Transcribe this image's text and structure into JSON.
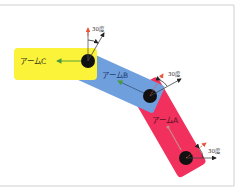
{
  "diagram": {
    "title": "",
    "colors": {
      "background": "#ffffff",
      "frame": "#d0d0d0",
      "arm_c": "#fbf23a",
      "arm_b": "#6f9fdc",
      "arm_a": "#f2305e",
      "joint": "#111111",
      "axis_line": "#333333",
      "reference_arrow": "#e8553a",
      "direction_arrow": "#4a9a3a"
    },
    "arms": [
      {
        "id": "C",
        "label": "アームC"
      },
      {
        "id": "B",
        "label": "アームB"
      },
      {
        "id": "A",
        "label": "アームA"
      }
    ],
    "angles": [
      {
        "joint": "C",
        "label": "30度"
      },
      {
        "joint": "B",
        "label": "30度"
      },
      {
        "joint": "A",
        "label": "30度"
      }
    ]
  }
}
